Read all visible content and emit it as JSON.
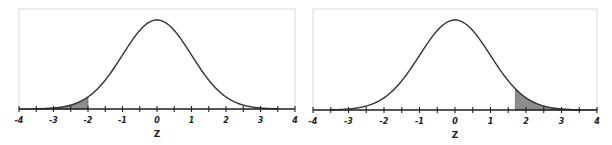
{
  "chart_data": [
    {
      "type": "area",
      "title": "",
      "description": "Standard normal density curve with shaded left tail",
      "xlabel": "Z",
      "ylabel": "",
      "xlim": [
        -4,
        4
      ],
      "x_ticks": [
        -4,
        -3,
        -2,
        -1,
        0,
        1,
        2,
        3,
        4
      ],
      "x_tick_labels": [
        "-4",
        "-3",
        "-2",
        "-1",
        "0",
        "1",
        "2",
        "3",
        "4"
      ],
      "minor_tick_step": 0.5,
      "curve": "standard normal pdf",
      "mean": 0,
      "sd": 1,
      "shaded_region": {
        "from": -4,
        "to": -2,
        "tail": "left"
      },
      "grid": false,
      "legend": null
    },
    {
      "type": "area",
      "title": "",
      "description": "Standard normal density curve with shaded right tail",
      "xlabel": "Z",
      "ylabel": "",
      "xlim": [
        -4,
        4
      ],
      "x_ticks": [
        -4,
        -3,
        -2,
        -1,
        0,
        1,
        2,
        3,
        4
      ],
      "x_tick_labels": [
        "-4",
        "-3",
        "-2",
        "-1",
        "0",
        "1",
        "2",
        "3",
        "4"
      ],
      "minor_tick_step": 0.5,
      "curve": "standard normal pdf",
      "mean": 0,
      "sd": 1,
      "shaded_region": {
        "from": 1.7,
        "to": 4,
        "tail": "right"
      },
      "grid": false,
      "legend": null
    }
  ],
  "style": {
    "curve_color": "#333333",
    "shade_color": "#8c8c8c",
    "axis_color": "#222222",
    "frame_color": "#dcdcdc"
  }
}
